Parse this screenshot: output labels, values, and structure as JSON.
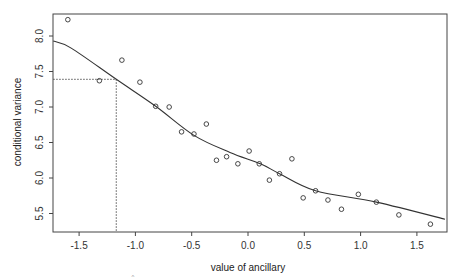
{
  "chart_data": {
    "type": "scatter",
    "title": "",
    "xlabel": "value of ancillary",
    "ylabel": "conditional variance",
    "xlim": [
      -1.73,
      1.75
    ],
    "ylim": [
      5.27,
      8.31
    ],
    "grid": false,
    "legend": null,
    "x_ticks": [
      -1.5,
      -1.0,
      -0.5,
      0.0,
      0.5,
      1.0,
      1.5
    ],
    "x_tick_labels": [
      "-1.5",
      "-1.0",
      "-0.5",
      "0.0",
      "0.5",
      "1.0",
      "1.5"
    ],
    "y_ticks": [
      5.5,
      6.0,
      6.5,
      7.0,
      7.5,
      8.0
    ],
    "y_tick_labels": [
      "5.5",
      "6.0",
      "6.5",
      "7.0",
      "7.5",
      "8.0"
    ],
    "series": [
      {
        "name": "observed",
        "kind": "points",
        "marker": "o",
        "x": [
          -1.6,
          -1.32,
          -1.12,
          -0.96,
          -0.82,
          -0.7,
          -0.59,
          -0.48,
          -0.37,
          -0.28,
          -0.19,
          -0.09,
          0.01,
          0.1,
          0.19,
          0.28,
          0.39,
          0.49,
          0.6,
          0.71,
          0.83,
          0.98,
          1.14,
          1.34,
          1.62
        ],
        "y": [
          8.23,
          7.37,
          7.66,
          7.35,
          7.01,
          7.0,
          6.65,
          6.62,
          6.76,
          6.25,
          6.3,
          6.2,
          6.38,
          6.2,
          5.97,
          6.06,
          6.27,
          5.72,
          5.82,
          5.69,
          5.56,
          5.77,
          5.66,
          5.48,
          5.35
        ]
      },
      {
        "name": "fitted curve",
        "kind": "line",
        "x": [
          -1.73,
          -1.57,
          -1.17,
          -0.82,
          -0.48,
          -0.16,
          0.11,
          0.28,
          0.6,
          1.14,
          1.75
        ],
        "y": [
          7.93,
          7.83,
          7.39,
          7.01,
          6.6,
          6.36,
          6.2,
          6.06,
          5.82,
          5.66,
          5.42
        ]
      }
    ],
    "annotations": [
      {
        "type": "dotted-hline",
        "y": 7.39,
        "x_from": -1.73,
        "x_to": -1.17
      },
      {
        "type": "dotted-vline",
        "x": -1.17,
        "y_from": 5.27,
        "y_to": 7.39
      }
    ]
  },
  "artifacts": {
    "hat_mark": "^"
  }
}
